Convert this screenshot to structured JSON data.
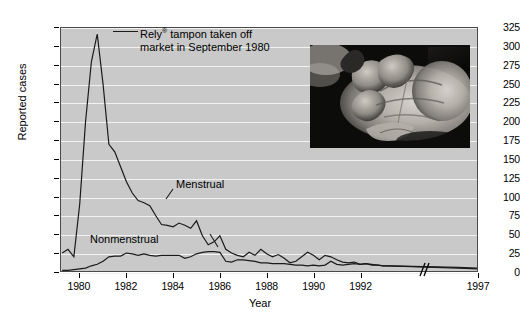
{
  "chart_data": {
    "type": "line",
    "title": "",
    "xlabel": "Year",
    "ylabel": "Reported cases",
    "ylim": [
      0,
      325
    ],
    "yticks": [
      0,
      25,
      50,
      75,
      100,
      125,
      150,
      175,
      200,
      225,
      250,
      275,
      300,
      325
    ],
    "xticks": [
      1980,
      1982,
      1984,
      1986,
      1988,
      1990,
      1992,
      1997
    ],
    "xlim": [
      1979.2,
      1997
    ],
    "grid": true,
    "legend_position": "inline-labels",
    "axis_break": {
      "label": "//",
      "between": [
        1993.2,
        1996.2
      ]
    },
    "annotations": [
      {
        "text": "Rely® tampon taken off market in September 1980",
        "points_to": {
          "x": 1980.75,
          "y": 317
        }
      }
    ],
    "series": [
      {
        "name": "Menstrual",
        "x": [
          1979.25,
          1979.5,
          1979.75,
          1980.0,
          1980.25,
          1980.5,
          1980.75,
          1981.0,
          1981.25,
          1981.5,
          1981.75,
          1982.0,
          1982.25,
          1982.5,
          1982.75,
          1983.0,
          1983.25,
          1983.5,
          1983.75,
          1984.0,
          1984.25,
          1984.5,
          1984.75,
          1985.0,
          1985.25,
          1985.5,
          1985.75,
          1986.0,
          1986.25,
          1986.5,
          1986.75,
          1987.0,
          1987.25,
          1987.5,
          1987.75,
          1988.0,
          1988.25,
          1988.5,
          1988.75,
          1989.0,
          1989.25,
          1989.5,
          1989.75,
          1990.0,
          1990.25,
          1990.5,
          1990.75,
          1991.0,
          1991.25,
          1991.5,
          1991.75,
          1992.0,
          1992.25,
          1992.5,
          1992.75,
          1993.0,
          1993.2,
          1996.2,
          1997.0
        ],
        "values": [
          25,
          30,
          20,
          90,
          200,
          280,
          317,
          250,
          170,
          160,
          140,
          120,
          105,
          95,
          92,
          88,
          75,
          63,
          62,
          60,
          65,
          62,
          58,
          68,
          48,
          36,
          40,
          48,
          30,
          25,
          22,
          20,
          26,
          22,
          30,
          24,
          20,
          23,
          18,
          12,
          14,
          20,
          26,
          22,
          16,
          22,
          20,
          16,
          13,
          12,
          13,
          10,
          11,
          9,
          9,
          8,
          8,
          6,
          5
        ],
        "peak": {
          "year": 1980.75,
          "value": 317
        }
      },
      {
        "name": "Nonmenstrual",
        "x": [
          1979.25,
          1979.5,
          1979.75,
          1980.0,
          1980.25,
          1980.5,
          1980.75,
          1981.0,
          1981.25,
          1981.5,
          1981.75,
          1982.0,
          1982.25,
          1982.5,
          1982.75,
          1983.0,
          1983.25,
          1983.5,
          1983.75,
          1984.0,
          1984.25,
          1984.5,
          1984.75,
          1985.0,
          1985.25,
          1985.5,
          1985.75,
          1986.0,
          1986.25,
          1986.5,
          1986.75,
          1987.0,
          1987.25,
          1987.5,
          1987.75,
          1988.0,
          1988.25,
          1988.5,
          1988.75,
          1989.0,
          1989.25,
          1989.5,
          1989.75,
          1990.0,
          1990.25,
          1990.5,
          1990.75,
          1991.0,
          1991.25,
          1991.5,
          1991.75,
          1992.0,
          1992.25,
          1992.5,
          1992.75,
          1993.0,
          1993.2,
          1996.2,
          1997.0
        ],
        "values": [
          2,
          2,
          3,
          4,
          5,
          8,
          10,
          14,
          20,
          21,
          21,
          25,
          24,
          22,
          24,
          22,
          21,
          22,
          22,
          22,
          22,
          18,
          20,
          24,
          26,
          27,
          27,
          26,
          14,
          13,
          16,
          16,
          15,
          14,
          12,
          12,
          11,
          11,
          11,
          10,
          9,
          9,
          8,
          9,
          8,
          9,
          14,
          10,
          9,
          10,
          11,
          10,
          11,
          10,
          9,
          8,
          8,
          5,
          4
        ]
      }
    ]
  },
  "labels": {
    "y_axis_title": "Reported cases",
    "x_axis_title": "Year",
    "series_menstrual": "Menstrual",
    "series_nonmenstrual": "Nonmenstrual",
    "axis_break_glyph": "//"
  },
  "annotation": {
    "line1_prefix": "Rely",
    "line1_mark": "®",
    "line1_suffix": " tampon taken off",
    "line2": "market in September 1980"
  },
  "photo": {
    "caption": "",
    "alt": "grayscale photograph of a hand with peeling skin"
  },
  "colors": {
    "plot_background": "#c9c9c9",
    "gridline": "#f2f2f2",
    "series_line": "#1a1a1a",
    "axis": "#000000",
    "page_background": "#ffffff"
  }
}
